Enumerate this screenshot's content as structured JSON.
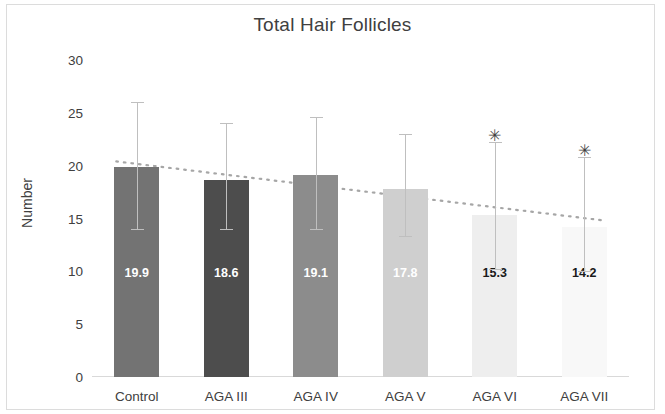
{
  "chart_data": {
    "type": "bar",
    "title": "Total Hair Follicles",
    "xlabel": "",
    "ylabel": "Number",
    "categories": [
      "Control",
      "AGA III",
      "AGA IV",
      "AGA V",
      "AGA VI",
      "AGA VII"
    ],
    "values": [
      19.9,
      18.6,
      19.1,
      17.8,
      15.3,
      14.2
    ],
    "value_labels": [
      "19.9",
      "18.6",
      "19.1",
      "17.8",
      "15.3",
      "14.2"
    ],
    "error_bars": [
      {
        "upper": 26.0,
        "lower": 14.0
      },
      {
        "upper": 24.0,
        "lower": 14.0
      },
      {
        "upper": 24.6,
        "lower": 14.0
      },
      {
        "upper": 23.0,
        "lower": 13.3
      },
      {
        "upper": 22.2,
        "lower": 10.2
      },
      {
        "upper": 20.8,
        "lower": 10.0
      }
    ],
    "significance_markers": [
      {
        "category": "AGA VI",
        "symbol": "✳",
        "value": 23.3
      },
      {
        "category": "AGA VII",
        "symbol": "✳",
        "value": 21.9
      }
    ],
    "bar_colors": [
      "#737373",
      "#4d4d4d",
      "#8c8c8c",
      "#cfcfcf",
      "#eeeeee",
      "#f8f8f8"
    ],
    "value_label_colors": [
      "#ffffff",
      "#ffffff",
      "#ffffff",
      "#ffffff",
      "#1a1a1a",
      "#1a1a1a"
    ],
    "yticks": [
      0,
      5,
      10,
      15,
      20,
      25,
      30
    ],
    "ytick_labels": [
      "0",
      "5",
      "10",
      "15",
      "20",
      "25",
      "30"
    ],
    "ylim": [
      0,
      30
    ],
    "grid": false,
    "legend": "none",
    "trendline": {
      "type": "linear-dotted",
      "color": "#a6a6a6",
      "start_value": 20.4,
      "end_value": 14.8
    }
  }
}
